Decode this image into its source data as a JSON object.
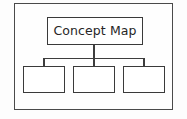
{
  "diagram": {
    "type": "concept-map-tree",
    "frame": {
      "label": ""
    },
    "root": {
      "label": "Concept Map"
    },
    "children": [
      {
        "label": ""
      },
      {
        "label": ""
      },
      {
        "label": ""
      }
    ],
    "connectors": {
      "root_stem": "vertical",
      "bus": "horizontal",
      "child_stems": [
        "vertical",
        "vertical",
        "vertical"
      ]
    },
    "colors": {
      "background": "#fdfdfd",
      "frame_stroke": "#4a4a4a",
      "box_stroke": "#3a3a3a",
      "box_fill": "#ffffff",
      "connector": "#3d3d3d",
      "text": "#262626"
    }
  }
}
